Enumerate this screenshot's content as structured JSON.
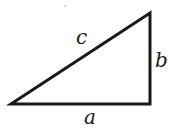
{
  "diagram": {
    "type": "right-triangle",
    "stroke_color": "#1a1a1a",
    "vertices": {
      "left": [
        11,
        104
      ],
      "right_angle": [
        150,
        104
      ],
      "top": [
        150,
        13
      ]
    },
    "labels": {
      "hypotenuse": "c",
      "vertical_leg": "b",
      "horizontal_leg": "a"
    }
  }
}
